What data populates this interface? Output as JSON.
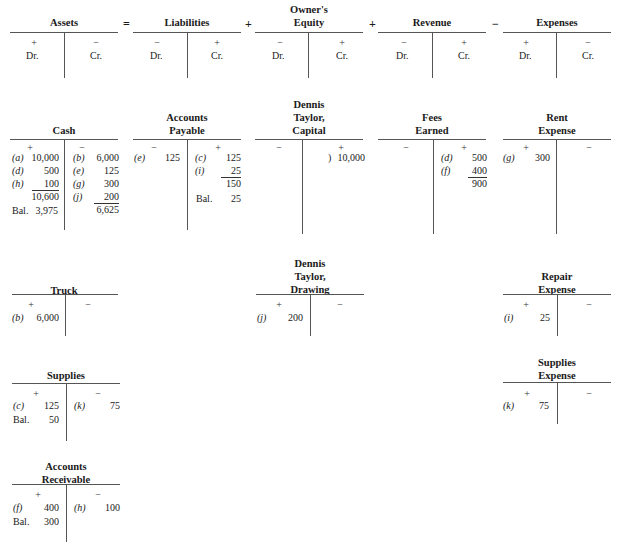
{
  "equation": {
    "owner_top": "Owner's",
    "parts": [
      {
        "title": "Assets",
        "left_sign": "+",
        "right_sign": "−",
        "left_label": "Dr.",
        "right_label": "Cr."
      },
      {
        "title": "Liabilities",
        "left_sign": "−",
        "right_sign": "+",
        "left_label": "Dr.",
        "right_label": "Cr."
      },
      {
        "title": "Equity",
        "left_sign": "−",
        "right_sign": "+",
        "left_label": "Dr.",
        "right_label": "Cr."
      },
      {
        "title": "Revenue",
        "left_sign": "−",
        "right_sign": "+",
        "left_label": "Dr.",
        "right_label": "Cr."
      },
      {
        "title": "Expenses",
        "left_sign": "+",
        "right_sign": "−",
        "left_label": "Dr.",
        "right_label": "Cr."
      }
    ],
    "operators": [
      "=",
      "+",
      "+",
      "−"
    ]
  },
  "accounts": {
    "cash": {
      "title": "Cash",
      "left_sign": "+",
      "right_sign": "−",
      "debits": [
        {
          "ref": "(a)",
          "amount": "10,000"
        },
        {
          "ref": "(d)",
          "amount": "500"
        },
        {
          "ref": "(h)",
          "amount": "100"
        }
      ],
      "debit_total": "10,600",
      "credits": [
        {
          "ref": "(b)",
          "amount": "6,000"
        },
        {
          "ref": "(e)",
          "amount": "125"
        },
        {
          "ref": "(g)",
          "amount": "300"
        },
        {
          "ref": "(j)",
          "amount": "200"
        }
      ],
      "credit_total": "6,625",
      "balance_label": "Bal.",
      "balance": "3,975"
    },
    "accounts_payable": {
      "title_1": "Accounts",
      "title_2": "Payable",
      "left_sign": "−",
      "right_sign": "+",
      "debits": [
        {
          "ref": "(e)",
          "amount": "125"
        }
      ],
      "credits": [
        {
          "ref": "(c)",
          "amount": "125"
        },
        {
          "ref": "(i)",
          "amount": "25"
        }
      ],
      "credit_total": "150",
      "balance_label": "Bal.",
      "balance": "25"
    },
    "capital": {
      "title_1": "Dennis",
      "title_2": "Taylor,",
      "title_3": "Capital",
      "left_sign": "−",
      "right_sign": "+",
      "credits": [
        {
          "ref": ")",
          "amount": "10,000"
        }
      ]
    },
    "fees_earned": {
      "title_1": "Fees",
      "title_2": "Earned",
      "left_sign": "−",
      "right_sign": "+",
      "credits": [
        {
          "ref": "(d)",
          "amount": "500"
        },
        {
          "ref": "(f)",
          "amount": "400"
        }
      ],
      "credit_total": "900"
    },
    "rent_expense": {
      "title_1": "Rent",
      "title_2": "Expense",
      "left_sign": "+",
      "right_sign": "−",
      "debits": [
        {
          "ref": "(g)",
          "amount": "300"
        }
      ]
    },
    "truck": {
      "title": "Truck",
      "left_sign": "+",
      "right_sign": "−",
      "debits": [
        {
          "ref": "(b)",
          "amount": "6,000"
        }
      ]
    },
    "drawing": {
      "title_1": "Dennis",
      "title_2": "Taylor,",
      "title_3": "Drawing",
      "left_sign": "+",
      "right_sign": "−",
      "debits": [
        {
          "ref": "(j)",
          "amount": "200"
        }
      ]
    },
    "repair_expense": {
      "title_1": "Repair",
      "title_2": "Expense",
      "left_sign": "+",
      "right_sign": "−",
      "debits": [
        {
          "ref": "(i)",
          "amount": "25"
        }
      ]
    },
    "supplies": {
      "title": "Supplies",
      "left_sign": "+",
      "right_sign": "−",
      "debits": [
        {
          "ref": "(c)",
          "amount": "125"
        }
      ],
      "credits": [
        {
          "ref": "(k)",
          "amount": "75"
        }
      ],
      "balance_label": "Bal.",
      "balance": "50"
    },
    "supplies_expense": {
      "title_1": "Supplies",
      "title_2": "Expense",
      "left_sign": "+",
      "right_sign": "−",
      "debits": [
        {
          "ref": "(k)",
          "amount": "75"
        }
      ]
    },
    "accounts_receivable": {
      "title_1": "Accounts",
      "title_2": "Receivable",
      "left_sign": "+",
      "right_sign": "−",
      "debits": [
        {
          "ref": "(f)",
          "amount": "400"
        }
      ],
      "credits": [
        {
          "ref": "(h)",
          "amount": "100"
        }
      ],
      "balance_label": "Bal.",
      "balance": "300"
    }
  }
}
